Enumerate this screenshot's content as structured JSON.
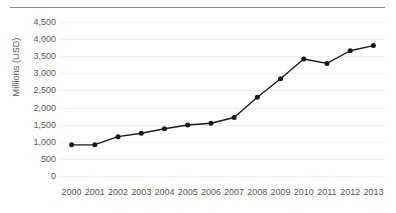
{
  "chart_data": {
    "type": "line",
    "title": "",
    "subtitle": "",
    "xlabel": "",
    "ylabel": "Millions (USD)",
    "categories": [
      "2000",
      "2001",
      "2002",
      "2003",
      "2004",
      "2005",
      "2006",
      "2007",
      "2008",
      "2009",
      "2010",
      "2011",
      "2012",
      "2013"
    ],
    "values": [
      910,
      915,
      1150,
      1250,
      1380,
      1490,
      1540,
      1710,
      2300,
      2840,
      3420,
      3290,
      3660,
      3810
    ],
    "ylim": [
      0,
      4500
    ],
    "ytick_values": [
      0,
      500,
      1000,
      1500,
      2000,
      2500,
      3000,
      3500,
      4000,
      4500
    ],
    "ytick_labels": [
      "0",
      "500",
      "1,000",
      "1,500",
      "2,000",
      "2,500",
      "3,000",
      "3,500",
      "4,000",
      "4,500"
    ],
    "grid": {
      "horizontal": true,
      "vertical": false
    },
    "legend": {
      "visible": false,
      "position": "none"
    },
    "marker": {
      "shape": "circle",
      "color": "#1a1a1a",
      "size": 5
    },
    "line": {
      "color": "#1a1a1a",
      "width": 1.4
    },
    "colors": {
      "series": "#1a1a1a",
      "gridline": "#f1f1f1",
      "tick_text": "#595959",
      "axis_title": "#595959",
      "top_rule": "#8a8a8a",
      "background": "#ffffff"
    }
  }
}
